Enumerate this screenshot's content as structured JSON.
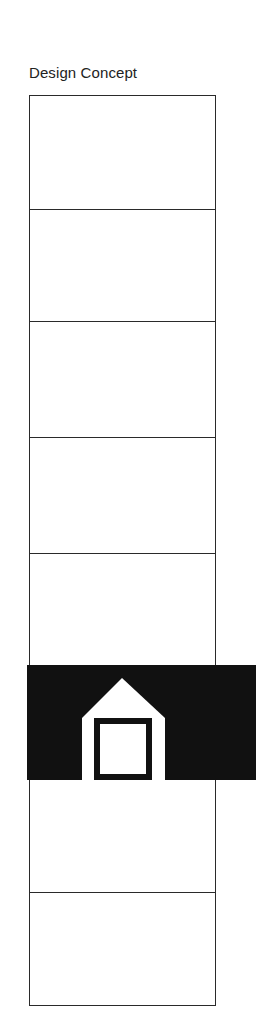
{
  "title": "Design Concept",
  "strip": {
    "cells": 8,
    "highlighted_cell_index": 5,
    "highlight_color": "#111111",
    "line_color": "#2a2a2a"
  },
  "icon": "house-icon"
}
